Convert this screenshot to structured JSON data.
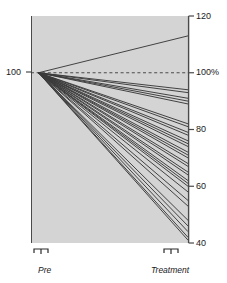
{
  "chart_data": {
    "type": "line",
    "title": "",
    "subtitle": "",
    "xlabel": "",
    "ylabel": "",
    "x_categories": [
      "Pre",
      "Treatment"
    ],
    "ylim": [
      40,
      120
    ],
    "y_ticks": [
      {
        "value": 120,
        "label": "120"
      },
      {
        "value": 100,
        "label": "100%"
      },
      {
        "value": 80,
        "label": "80"
      },
      {
        "value": 60,
        "label": "60"
      },
      {
        "value": 40,
        "label": "40"
      }
    ],
    "left_axis_ticks": [
      {
        "value": 100,
        "label": "100"
      }
    ],
    "reference_line": {
      "value": 100,
      "style": "dashed",
      "label": "100%"
    },
    "grid": false,
    "legend_position": "none",
    "plot_background": "#d4d4d4",
    "line_color": "#3a3a3a",
    "series_note": "Each line is one subject measured at Pre and after Treatment, normalized so Pre = 100.",
    "series": [
      {
        "name": "S1",
        "values": [
          100,
          113
        ]
      },
      {
        "name": "S2",
        "values": [
          100,
          94
        ]
      },
      {
        "name": "S3",
        "values": [
          100,
          93
        ]
      },
      {
        "name": "S4",
        "values": [
          100,
          91
        ]
      },
      {
        "name": "S5",
        "values": [
          100,
          90
        ]
      },
      {
        "name": "S6",
        "values": [
          100,
          89
        ]
      },
      {
        "name": "S7",
        "values": [
          100,
          82
        ]
      },
      {
        "name": "S8",
        "values": [
          100,
          81
        ]
      },
      {
        "name": "S9",
        "values": [
          100,
          79
        ]
      },
      {
        "name": "S10",
        "values": [
          100,
          78
        ]
      },
      {
        "name": "S11",
        "values": [
          100,
          76
        ]
      },
      {
        "name": "S12",
        "values": [
          100,
          75
        ]
      },
      {
        "name": "S13",
        "values": [
          100,
          74
        ]
      },
      {
        "name": "S14",
        "values": [
          100,
          72
        ]
      },
      {
        "name": "S15",
        "values": [
          100,
          71
        ]
      },
      {
        "name": "S16",
        "values": [
          100,
          70
        ]
      },
      {
        "name": "S17",
        "values": [
          100,
          68
        ]
      },
      {
        "name": "S18",
        "values": [
          100,
          67
        ]
      },
      {
        "name": "S19",
        "values": [
          100,
          65
        ]
      },
      {
        "name": "S20",
        "values": [
          100,
          64
        ]
      },
      {
        "name": "S21",
        "values": [
          100,
          62
        ]
      },
      {
        "name": "S22",
        "values": [
          100,
          61
        ]
      },
      {
        "name": "S23",
        "values": [
          100,
          60
        ]
      },
      {
        "name": "S24",
        "values": [
          100,
          58
        ]
      },
      {
        "name": "S25",
        "values": [
          100,
          55
        ]
      },
      {
        "name": "S26",
        "values": [
          100,
          53
        ]
      },
      {
        "name": "S27",
        "values": [
          100,
          48
        ]
      },
      {
        "name": "S28",
        "values": [
          100,
          46
        ]
      },
      {
        "name": "S29",
        "values": [
          100,
          44
        ]
      },
      {
        "name": "S30",
        "values": [
          100,
          42
        ]
      },
      {
        "name": "S31",
        "values": [
          100,
          41
        ]
      }
    ]
  },
  "axis": {
    "left_label_100": "100",
    "right_labels": [
      "120",
      "100%",
      "80",
      "60",
      "40"
    ]
  },
  "brackets": {
    "pre_label": "Pre",
    "treatment_label": "Treatment"
  }
}
